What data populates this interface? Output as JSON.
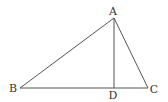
{
  "diagram": {
    "type": "geometry-triangle",
    "points": {
      "A": {
        "label": "A",
        "x": 114,
        "y": 18,
        "label_x": 113,
        "label_y": 15
      },
      "B": {
        "label": "B",
        "x": 20,
        "y": 88,
        "label_x": 13,
        "label_y": 92
      },
      "C": {
        "label": "C",
        "x": 148,
        "y": 88,
        "label_x": 154,
        "label_y": 93
      },
      "D": {
        "label": "D",
        "x": 114,
        "y": 88,
        "label_x": 113,
        "label_y": 99
      }
    },
    "segments": [
      {
        "from": "A",
        "to": "B"
      },
      {
        "from": "A",
        "to": "C"
      },
      {
        "from": "B",
        "to": "C"
      },
      {
        "from": "A",
        "to": "D"
      }
    ],
    "colors": {
      "line": "#555555",
      "text": "#333333",
      "background": "#ffffff"
    }
  }
}
